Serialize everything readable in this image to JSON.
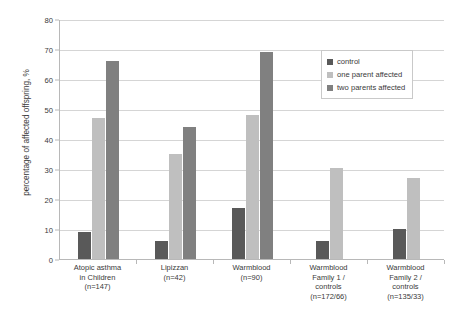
{
  "chart_data": {
    "type": "bar",
    "title": "",
    "subtitle": "",
    "xlabel": "",
    "ylabel": "percentage of affected offspring, %",
    "ylim": [
      0,
      80
    ],
    "ytick_step": 10,
    "yticks": [
      "0",
      "10",
      "20",
      "30",
      "40",
      "50",
      "60",
      "70",
      "80"
    ],
    "grid": true,
    "legend_position": "top-right",
    "categories": [
      "Atopic asthma\nin Children\n(n=147)",
      "Lipizzan\n(n=42)",
      "Warmblood\n(n=90)",
      "Warmblood\nFamily 1 /\ncontrols\n(n=172/66)",
      "Warmblood\nFamily 2 /\ncontrols\n(n=135/33)"
    ],
    "category_lines": [
      [
        "Atopic asthma",
        "in Children",
        "(n=147)"
      ],
      [
        "Lipizzan",
        "(n=42)"
      ],
      [
        "Warmblood",
        "(n=90)"
      ],
      [
        "Warmblood",
        "Family 1 /",
        "controls",
        "(n=172/66)"
      ],
      [
        "Warmblood",
        "Family 2 /",
        "controls",
        "(n=135/33)"
      ]
    ],
    "series": [
      {
        "name": "control",
        "color": "#595959",
        "values": [
          9,
          6,
          17,
          6,
          10
        ]
      },
      {
        "name": "one parent affected",
        "color": "#bfbfbf",
        "values": [
          47,
          35,
          48,
          30.5,
          27
        ]
      },
      {
        "name": "two parents affected",
        "color": "#808080",
        "values": [
          66,
          44,
          69,
          null,
          null
        ]
      }
    ]
  },
  "legend": {
    "items": [
      {
        "label": "control",
        "color": "#595959"
      },
      {
        "label": "one parent affected",
        "color": "#bfbfbf"
      },
      {
        "label": "two parents affected",
        "color": "#808080"
      }
    ]
  },
  "colors": {
    "control": "#595959",
    "one_parent": "#bfbfbf",
    "two_parents": "#808080",
    "gridline": "#d5d5d5",
    "axis": "#b8b8b8",
    "text": "#3a3a3a",
    "background": "#ffffff"
  }
}
